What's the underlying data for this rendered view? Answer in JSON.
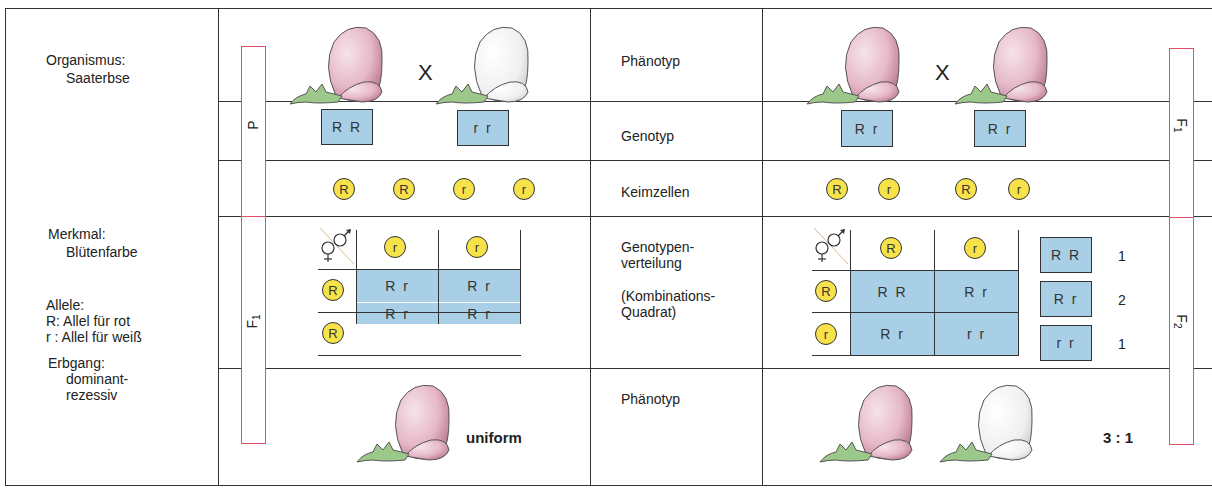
{
  "left_panel": {
    "organism_label": "Organismus:",
    "organism_value": "Saaterbse",
    "trait_label": "Merkmal:",
    "trait_value": "Blütenfarbe",
    "alleles_label": "Allele:",
    "allele_R": "R: Allel für rot",
    "allele_r": "r : Allel für weiß",
    "inheritance_label": "Erbgang:",
    "inheritance_value_1": "dominant-",
    "inheritance_value_2": "rezessiv"
  },
  "row_labels": {
    "phenotype": "Phänotyp",
    "genotype": "Genotyp",
    "gametes": "Keimzellen",
    "distribution_1": "Genotypen-",
    "distribution_2": "verteilung",
    "combination_1": "(Kombinations-",
    "combination_2": "Quadrat)",
    "offspring_phenotype": "Phänotyp"
  },
  "brackets": {
    "left_top": "P",
    "left_bottom": "F",
    "left_bottom_sub": "1",
    "right_top": "F",
    "right_top_sub": "1",
    "right_bottom": "F",
    "right_bottom_sub": "2"
  },
  "first_cross": {
    "cross_symbol": "X",
    "parent1": {
      "color": "red",
      "genotype": "R R"
    },
    "parent2": {
      "color": "white",
      "genotype": "r r"
    },
    "gametes": [
      "R",
      "R",
      "r",
      "r"
    ],
    "punnett": {
      "male_header": [
        "r",
        "r"
      ],
      "female_header": [
        "R",
        "R"
      ],
      "cells": [
        [
          "R r",
          "R r"
        ],
        [
          "R r",
          "R r"
        ]
      ]
    },
    "offspring_label": "uniform"
  },
  "second_cross": {
    "cross_symbol": "X",
    "parent1": {
      "color": "red",
      "genotype": "R r"
    },
    "parent2": {
      "color": "red",
      "genotype": "R r"
    },
    "gametes": [
      "R",
      "r",
      "R",
      "r"
    ],
    "punnett": {
      "male_header": [
        "R",
        "r"
      ],
      "female_header": [
        "R",
        "r"
      ],
      "cells": [
        [
          "R R",
          "R r"
        ],
        [
          "R r",
          "r r"
        ]
      ]
    },
    "distribution": [
      {
        "genotype": "R R",
        "count": "1"
      },
      {
        "genotype": "R r",
        "count": "2"
      },
      {
        "genotype": "r r",
        "count": "1"
      }
    ],
    "ratio": "3 : 1"
  },
  "colors": {
    "genotype_box": "#a9cfe6",
    "gamete_circle": "#f7e24a",
    "bracket": "#e0506a",
    "flower_red": "#e3b2c4",
    "flower_white": "#f3f3f3",
    "sepal_green": "#9cc98a"
  }
}
